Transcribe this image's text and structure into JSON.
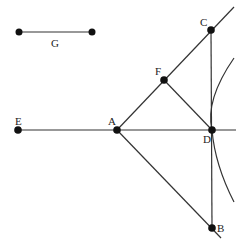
{
  "diagram": {
    "type": "geometry-construction",
    "points": [
      {
        "id": "A",
        "label": "A",
        "x": 117,
        "y": 130,
        "lx": 108,
        "ly": 125
      },
      {
        "id": "B",
        "label": "B",
        "x": 212,
        "y": 228,
        "lx": 217,
        "ly": 232
      },
      {
        "id": "C",
        "label": "C",
        "x": 211,
        "y": 30,
        "lx": 200,
        "ly": 26
      },
      {
        "id": "D",
        "label": "D",
        "x": 212,
        "y": 130,
        "lx": 203,
        "ly": 143
      },
      {
        "id": "E",
        "label": "E",
        "x": 18,
        "y": 130,
        "lx": 15,
        "ly": 125
      },
      {
        "id": "F",
        "label": "F",
        "x": 164,
        "y": 80,
        "lx": 155,
        "ly": 75
      }
    ],
    "segment_G": {
      "label": "G",
      "x1": 19,
      "y1": 32,
      "x2": 92,
      "y2": 32,
      "lx": 51,
      "ly": 47
    },
    "lines": [
      {
        "name": "line-E-D",
        "x1": 18,
        "y1": 130,
        "x2": 236,
        "y2": 130
      },
      {
        "name": "line-A-C",
        "x1": 117,
        "y1": 130,
        "x2": 234,
        "y2": 7
      },
      {
        "name": "line-A-B",
        "x1": 117,
        "y1": 130,
        "x2": 221,
        "y2": 238
      },
      {
        "name": "line-C-B",
        "x1": 211,
        "y1": 30,
        "x2": 212,
        "y2": 228
      },
      {
        "name": "line-F-D",
        "x1": 164,
        "y1": 80,
        "x2": 212,
        "y2": 130
      }
    ],
    "arc": {
      "name": "arc-through-D",
      "d": "M 234 58 Q 205 100 212 130 Q 215 165 234 202"
    }
  }
}
